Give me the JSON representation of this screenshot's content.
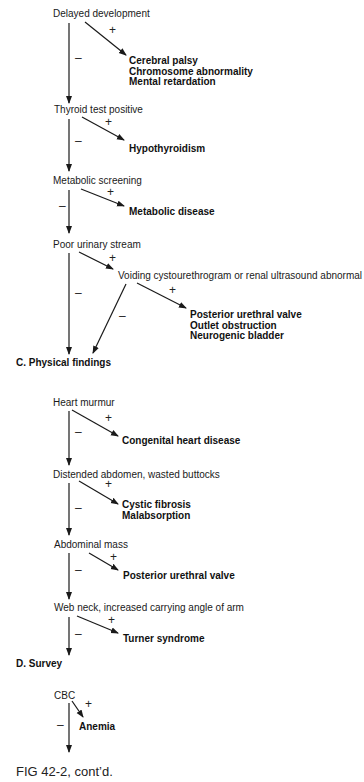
{
  "flow_c_prev": {
    "nodes": [
      {
        "label": "Delayed development",
        "positive": [
          "Cerebral palsy",
          "Chromosome abnormality",
          "Mental retardation"
        ]
      },
      {
        "label": "Thyroid test positive",
        "positive": [
          "Hypothyroidism"
        ]
      },
      {
        "label": "Metabolic screening",
        "positive": [
          "Metabolic disease"
        ]
      },
      {
        "label": "Poor urinary stream",
        "positive_step": "Voiding cystourethrogram or renal ultrasound abnormal",
        "positive": [
          "Posterior urethral valve",
          "Outlet obstruction",
          "Neurogenic bladder"
        ]
      }
    ],
    "plus": "+",
    "minus": "–"
  },
  "section_c": {
    "title": "C.  Physical findings"
  },
  "flow_c": {
    "nodes": [
      {
        "label": "Heart murmur",
        "positive": [
          "Congenital heart disease"
        ]
      },
      {
        "label": "Distended abdomen, wasted buttocks",
        "positive": [
          "Cystic fibrosis",
          "Malabsorption"
        ]
      },
      {
        "label": "Abdominal mass",
        "positive": [
          "Posterior urethral valve"
        ]
      },
      {
        "label": "Web neck, increased carrying angle of arm",
        "positive": [
          "Turner syndrome"
        ]
      }
    ]
  },
  "section_d": {
    "title": "D.  Survey"
  },
  "flow_d": {
    "nodes": [
      {
        "label": "CBC",
        "positive": [
          "Anemia"
        ]
      }
    ]
  },
  "caption": "FIG 42-2, cont’d."
}
